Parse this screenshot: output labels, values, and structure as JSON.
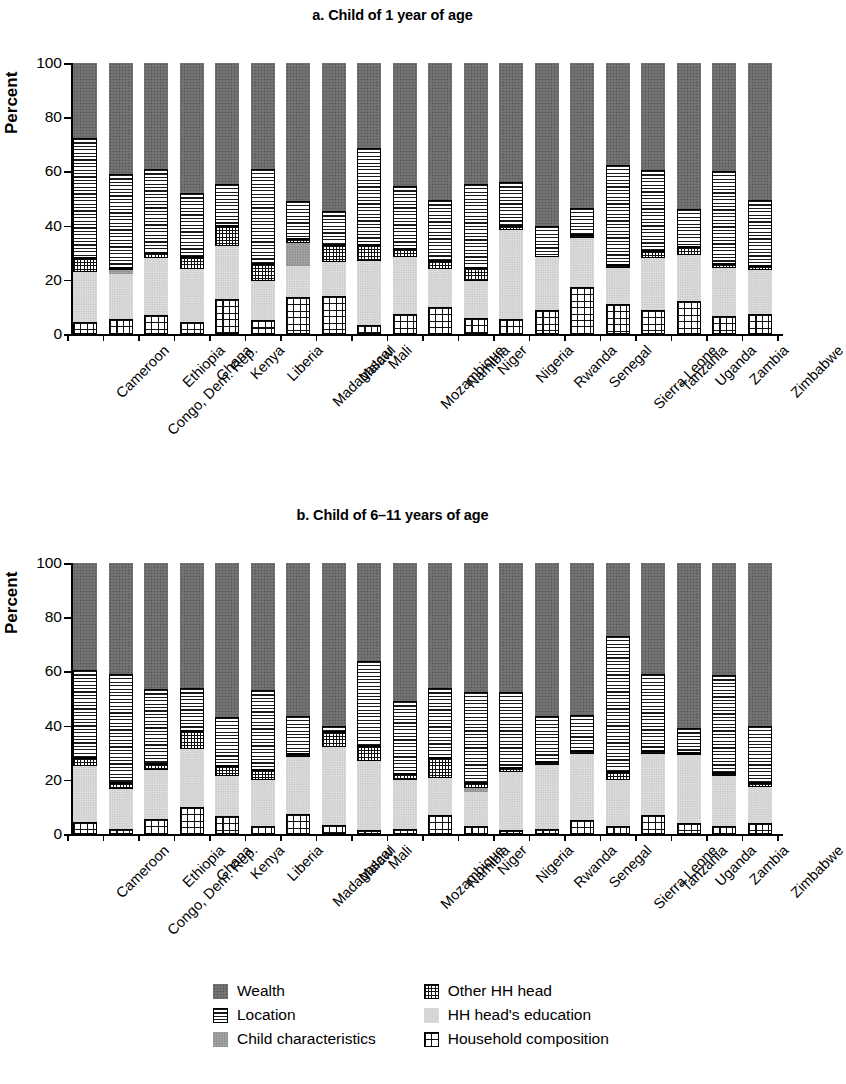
{
  "panels": [
    {
      "id": "a",
      "title": "a. Child of 1 year of age",
      "ylabel": "Percent"
    },
    {
      "id": "b",
      "title": "b. Child of 6–11 years of age",
      "ylabel": "Percent"
    }
  ],
  "legend": {
    "items": [
      {
        "label": "Wealth",
        "key": "wealth",
        "pattern": "solid-dark-gray",
        "color": "#6d6d6d"
      },
      {
        "label": "Other HH head",
        "key": "other_hh_head",
        "pattern": "checkered",
        "color": "#ffffff"
      },
      {
        "label": "Location",
        "key": "location",
        "pattern": "horizontal-lines",
        "color": "#ffffff"
      },
      {
        "label": "HH head's education",
        "key": "hh_head_education",
        "pattern": "light-gray-stipple",
        "color": "#d6d6d6"
      },
      {
        "label": "Child characteristics",
        "key": "child_characteristics",
        "pattern": "medium-gray-stipple",
        "color": "#9c9c9c"
      },
      {
        "label": "Household composition",
        "key": "household_composition",
        "pattern": "grid",
        "color": "#ffffff"
      }
    ]
  },
  "chart_data": {
    "type": "bar",
    "subtype": "stacked-bar",
    "ylabel": "Percent",
    "xlabel": "",
    "ylim": [
      0,
      100
    ],
    "yticks": [
      0,
      20,
      40,
      60,
      80,
      100
    ],
    "grid": false,
    "legend_position": "bottom",
    "stack_order_bottom_to_top": [
      "household_composition",
      "hh_head_education",
      "child_characteristics",
      "other_hh_head",
      "location",
      "wealth"
    ],
    "categories": [
      "Cameroon",
      "Congo, Dem. Rep.",
      "Ethiopia",
      "Ghana",
      "Kenya",
      "Liberia",
      "Madagascar",
      "Malawi",
      "Mali",
      "Mozambique",
      "Namibia",
      "Niger",
      "Nigeria",
      "Rwanda",
      "Senegal",
      "Sierra Leone",
      "Tanzania",
      "Uganda",
      "Zambia",
      "Zimbabwe"
    ],
    "panels": [
      {
        "id": "a",
        "title": "a. Child of 1 year of age",
        "series": [
          {
            "name": "Household composition",
            "key": "household_composition",
            "values": [
              4.5,
              5.5,
              7.0,
              4.5,
              13.0,
              5.0,
              13.5,
              14.0,
              3.5,
              7.5,
              10.0,
              6.0,
              5.5,
              9.0,
              17.5,
              11.0,
              9.0,
              12.0,
              6.5,
              7.5
            ]
          },
          {
            "name": "HH head's education",
            "key": "hh_head_education",
            "values": [
              18.5,
              16.5,
              21.0,
              19.5,
              19.5,
              14.5,
              11.5,
              12.5,
              23.5,
              21.0,
              14.0,
              13.5,
              33.0,
              19.5,
              18.0,
              13.5,
              19.0,
              17.0,
              18.0,
              16.0
            ]
          },
          {
            "name": "Child characteristics",
            "key": "child_characteristics",
            "values": [
              0.0,
              1.5,
              0.0,
              0.0,
              0.0,
              0.0,
              8.5,
              0.0,
              0.0,
              0.0,
              0.0,
              0.0,
              0.0,
              0.0,
              0.0,
              0.0,
              0.0,
              0.0,
              0.0,
              0.0
            ]
          },
          {
            "name": "Other HH head",
            "key": "other_hh_head",
            "values": [
              5.0,
              1.0,
              2.0,
              4.5,
              7.5,
              6.5,
              1.5,
              6.5,
              6.0,
              3.0,
              3.0,
              5.0,
              1.5,
              0.0,
              1.0,
              1.0,
              2.5,
              3.0,
              1.5,
              1.5
            ]
          },
          {
            "name": "Location",
            "key": "location",
            "values": [
              44.5,
              34.5,
              31.0,
              23.5,
              15.5,
              35.0,
              14.0,
              12.5,
              35.5,
              23.0,
              22.5,
              31.0,
              16.0,
              11.5,
              10.0,
              37.0,
              30.0,
              14.0,
              34.0,
              24.5
            ]
          },
          {
            "name": "Wealth",
            "key": "wealth",
            "values": [
              27.5,
              41.0,
              39.0,
              48.0,
              44.5,
              39.0,
              51.0,
              54.5,
              31.5,
              45.5,
              50.5,
              44.5,
              44.0,
              60.0,
              53.5,
              37.5,
              39.5,
              54.0,
              40.0,
              50.5
            ]
          }
        ]
      },
      {
        "id": "b",
        "title": "b. Child of 6–11 years of age",
        "series": [
          {
            "name": "Household composition",
            "key": "household_composition",
            "values": [
              4.5,
              2.0,
              5.5,
              10.0,
              6.5,
              3.0,
              7.5,
              3.5,
              1.5,
              2.0,
              7.0,
              3.0,
              1.5,
              2.0,
              5.0,
              3.0,
              7.0,
              4.0,
              3.0,
              4.0
            ]
          },
          {
            "name": "HH head's education",
            "key": "hh_head_education",
            "values": [
              20.5,
              14.5,
              18.0,
              21.5,
              15.0,
              17.0,
              21.0,
              28.5,
              25.5,
              18.0,
              13.5,
              12.5,
              21.5,
              23.5,
              24.5,
              17.0,
              22.5,
              25.0,
              18.5,
              13.5
            ]
          },
          {
            "name": "Child characteristics",
            "key": "child_characteristics",
            "values": [
              0.0,
              0.0,
              0.0,
              0.0,
              0.0,
              0.0,
              0.0,
              0.0,
              0.0,
              0.0,
              0.0,
              1.5,
              0.0,
              0.0,
              0.0,
              0.0,
              0.0,
              0.0,
              0.0,
              0.0
            ]
          },
          {
            "name": "Other HH head",
            "key": "other_hh_head",
            "values": [
              3.0,
              2.5,
              2.5,
              6.5,
              3.5,
              3.5,
              1.0,
              5.5,
              5.5,
              2.0,
              7.5,
              2.0,
              1.5,
              1.0,
              1.0,
              3.0,
              1.0,
              1.0,
              1.0,
              1.5
            ]
          },
          {
            "name": "Location",
            "key": "location",
            "values": [
              32.5,
              40.0,
              27.5,
              16.0,
              18.0,
              29.5,
              14.0,
              2.5,
              31.5,
              27.0,
              26.0,
              33.5,
              28.0,
              17.0,
              13.5,
              50.0,
              28.5,
              9.0,
              36.0,
              21.0
            ]
          },
          {
            "name": "Wealth",
            "key": "wealth",
            "values": [
              39.5,
              41.0,
              46.5,
              46.0,
              57.0,
              47.0,
              56.5,
              60.0,
              36.0,
              51.0,
              46.0,
              47.5,
              47.5,
              56.5,
              56.0,
              27.0,
              41.0,
              61.0,
              41.5,
              60.0
            ]
          }
        ]
      }
    ]
  }
}
